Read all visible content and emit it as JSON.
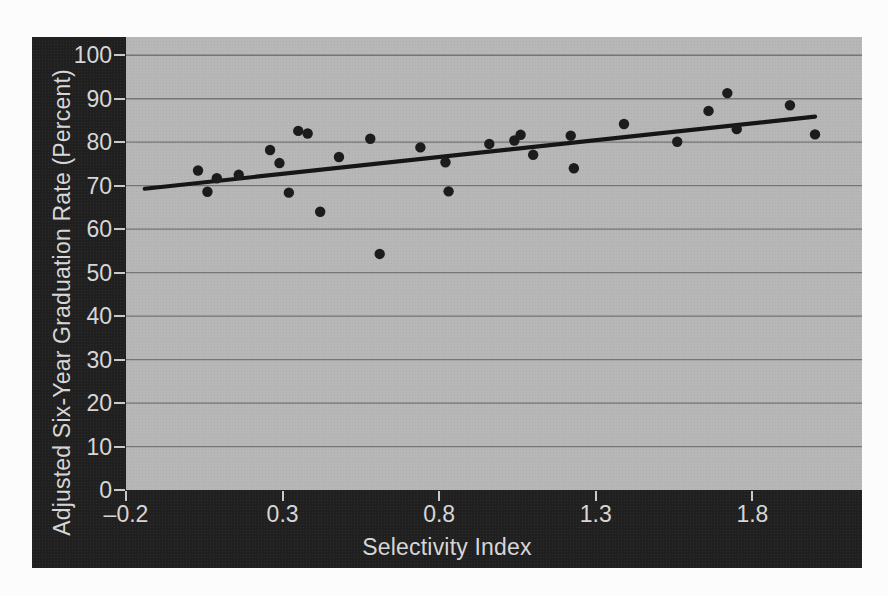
{
  "chart_data": {
    "type": "scatter",
    "title": "",
    "xlabel": "Selectivity Index",
    "ylabel": "Adjusted Six-Year Graduation Rate (Percent)",
    "x_axis": {
      "min": -0.2,
      "max": 2.15,
      "tick_values": [
        -0.2,
        0.3,
        0.8,
        1.3,
        1.8
      ],
      "tick_labels": [
        "–0.2",
        "0.3",
        "0.8",
        "1.3",
        "1.8"
      ]
    },
    "y_axis": {
      "min": 0,
      "max": 104.2,
      "tick_values": [
        0,
        10,
        20,
        30,
        40,
        50,
        60,
        70,
        80,
        90,
        100
      ],
      "tick_labels": [
        "0",
        "10",
        "20",
        "30",
        "40",
        "50",
        "60",
        "70",
        "80",
        "90",
        "100"
      ]
    },
    "grid": "horizontal",
    "legend": "none",
    "points": [
      [
        0.03,
        73.5
      ],
      [
        0.06,
        68.6
      ],
      [
        0.09,
        71.7
      ],
      [
        0.16,
        72.5
      ],
      [
        0.26,
        78.2
      ],
      [
        0.29,
        75.2
      ],
      [
        0.32,
        68.4
      ],
      [
        0.35,
        82.6
      ],
      [
        0.38,
        82.0
      ],
      [
        0.42,
        64.0
      ],
      [
        0.48,
        76.6
      ],
      [
        0.58,
        80.8
      ],
      [
        0.61,
        54.3
      ],
      [
        0.74,
        78.8
      ],
      [
        0.82,
        75.4
      ],
      [
        0.83,
        68.7
      ],
      [
        0.96,
        79.6
      ],
      [
        1.04,
        80.4
      ],
      [
        1.06,
        81.7
      ],
      [
        1.1,
        77.1
      ],
      [
        1.22,
        81.5
      ],
      [
        1.23,
        74.0
      ],
      [
        1.39,
        84.2
      ],
      [
        1.56,
        80.1
      ],
      [
        1.66,
        87.2
      ],
      [
        1.72,
        91.3
      ],
      [
        1.75,
        83.0
      ],
      [
        1.92,
        88.5
      ],
      [
        2.0,
        81.8
      ]
    ],
    "trendline": {
      "x1": -0.14,
      "y1": 69.3,
      "x2": 2.0,
      "y2": 85.9
    },
    "colors": {
      "chart_background": "#212020",
      "plot_background": "#b7b7b7",
      "gridline": "#757575",
      "point": "#1d1c1c",
      "trendline": "#161616",
      "tick_mark": "#c9c9c9",
      "label_text": "#d6d6d6"
    }
  }
}
